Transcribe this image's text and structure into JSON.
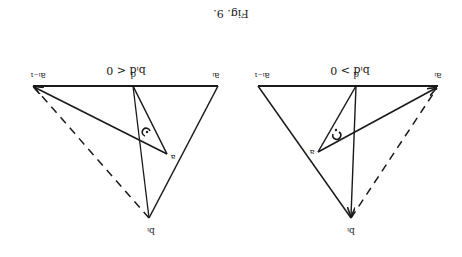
{
  "figure": {
    "caption": "Fig. 9.",
    "orientation": "rotated 180°",
    "stroke_color": "#1a1a1a",
    "background": "#ffffff"
  },
  "panels": [
    {
      "id": "left",
      "condition": "bᵢd < 0",
      "labels": {
        "a_prev": "aᵢ₋₁",
        "d": "d",
        "a_i": "aᵢ",
        "a": "a",
        "b_i": "bᵢ"
      },
      "rotation_symbol": "clockwise-arrow"
    },
    {
      "id": "right",
      "condition": "bᵢd > 0",
      "labels": {
        "a_prev": "aᵢ₋₁",
        "d": "d",
        "a_i": "aᵢ",
        "a": "a",
        "b_i": "bᵢ"
      },
      "rotation_symbol": "counterclockwise-arrow"
    }
  ]
}
